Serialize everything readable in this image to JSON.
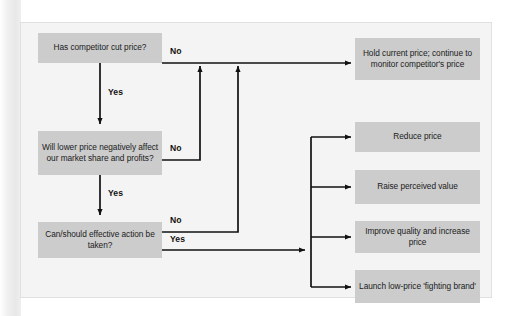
{
  "figure": {
    "type": "flowchart",
    "colors": {
      "node_fill": "#cccccc",
      "canvas": "#f4f4f4",
      "line": "#111111",
      "text": "#1b1b1b"
    }
  },
  "decisions": [
    {
      "id": "d1",
      "lines": [
        "Has competitor",
        "cut price?"
      ],
      "text": "Has competitor cut price?"
    },
    {
      "id": "d2",
      "lines": [
        "Will lower price",
        "negatively affect our",
        "market share and profits?"
      ],
      "text": "Will lower price negatively affect our market share and profits?"
    },
    {
      "id": "d3",
      "lines": [
        "Can/should effective",
        "action be taken?"
      ],
      "text": "Can/should effective action be taken?"
    }
  ],
  "outcomes": [
    {
      "id": "o1",
      "lines": [
        "Hold current price;",
        "continue to monitor",
        "competitor's price"
      ],
      "text": "Hold current price; continue to monitor competitor's price"
    },
    {
      "id": "o2",
      "lines": [
        "Reduce price"
      ],
      "text": "Reduce price"
    },
    {
      "id": "o3",
      "lines": [
        "Raise perceived",
        "value"
      ],
      "text": "Raise perceived value"
    },
    {
      "id": "o4",
      "lines": [
        "Improve quality",
        "and increase price"
      ],
      "text": "Improve quality and increase price"
    },
    {
      "id": "o5",
      "lines": [
        "Launch low-price",
        "'fighting brand'"
      ],
      "text": "Launch low-price 'fighting brand'"
    }
  ],
  "edge_labels": {
    "d1_no": "No",
    "d1_yes": "Yes",
    "d2_no": "No",
    "d2_yes": "Yes",
    "d3_no": "No",
    "d3_yes": "Yes"
  }
}
